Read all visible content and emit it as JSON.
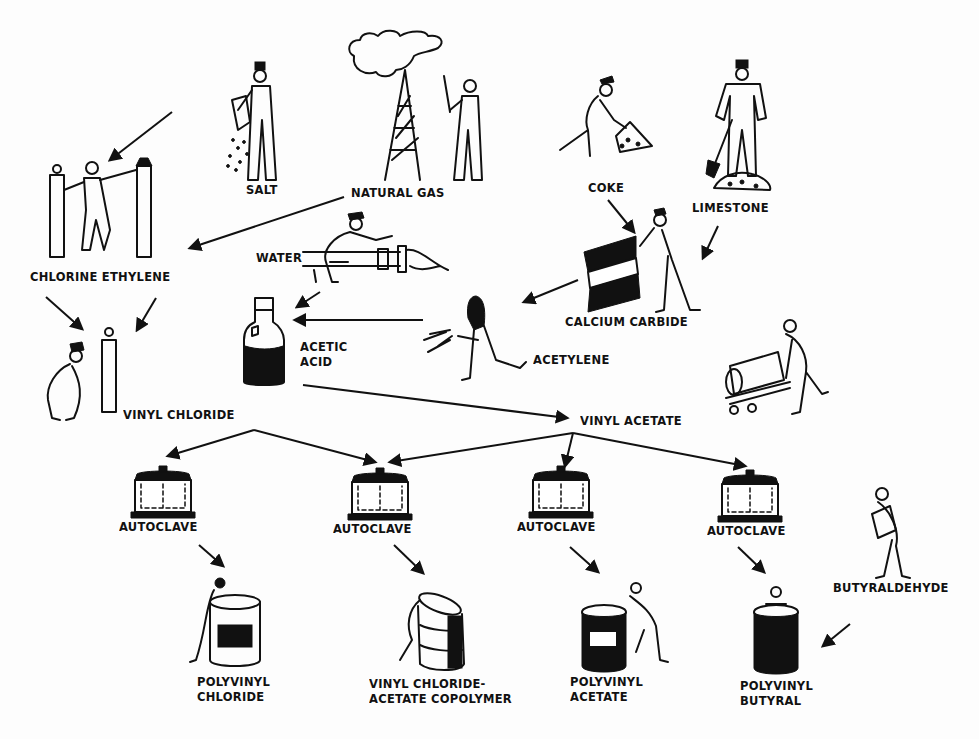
{
  "diagram": {
    "colors": {
      "ink": "#111111",
      "paper": "#fdfdfd"
    },
    "raw_materials": [
      {
        "id": "salt",
        "label": "SALT",
        "x": 246,
        "y": 188,
        "icon": "worker-pouring-salt-icon"
      },
      {
        "id": "natural_gas",
        "label": "NATURAL GAS",
        "x": 351,
        "y": 191,
        "icon": "gas-derrick-icon"
      },
      {
        "id": "coke",
        "label": "COKE",
        "x": 588,
        "y": 186,
        "icon": "worker-shoveling-coke-icon"
      },
      {
        "id": "limestone",
        "label": "LIMESTONE",
        "x": 692,
        "y": 206,
        "icon": "worker-with-limestone-icon"
      },
      {
        "id": "water",
        "label": "WATER",
        "x": 256,
        "y": 256,
        "icon": "water-pipe-worker-icon"
      },
      {
        "id": "butyraldehyde",
        "label": "BUTYRALDEHYDE",
        "x": 833,
        "y": 586,
        "icon": "worker-carrying-drum-icon"
      }
    ],
    "intermediates": [
      {
        "id": "chlorine_ethylene",
        "label": "CHLORINE ETHYLENE",
        "x": 30,
        "y": 275,
        "icon": "gas-cylinders-worker-icon"
      },
      {
        "id": "calcium_carbide",
        "label": "CALCIUM CARBIDE",
        "x": 565,
        "y": 320,
        "icon": "carbide-drum-icon"
      },
      {
        "id": "acetic_acid",
        "label": "ACETIC\nACID",
        "x": 300,
        "y": 345,
        "icon": "acid-bottle-icon"
      },
      {
        "id": "acetylene",
        "label": "ACETYLENE",
        "x": 533,
        "y": 358,
        "icon": "welder-icon"
      },
      {
        "id": "vinyl_chloride",
        "label": "VINYL CHLORIDE",
        "x": 123,
        "y": 413,
        "icon": "cylinder-worker-icon"
      },
      {
        "id": "vinyl_acetate",
        "label": "VINYL ACETATE",
        "x": 580,
        "y": 419,
        "icon": "drum-cart-worker-icon"
      }
    ],
    "autoclaves": [
      {
        "id": "autoclave_1",
        "label": "AUTOCLAVE",
        "x": 119,
        "y": 525,
        "cx": 163
      },
      {
        "id": "autoclave_2",
        "label": "AUTOCLAVE",
        "x": 333,
        "y": 527,
        "cx": 380
      },
      {
        "id": "autoclave_3",
        "label": "AUTOCLAVE",
        "x": 517,
        "y": 525,
        "cx": 561
      },
      {
        "id": "autoclave_4",
        "label": "AUTOCLAVE",
        "x": 707,
        "y": 529,
        "cx": 750
      }
    ],
    "products": [
      {
        "id": "pvc",
        "label": "POLYVINYL\nCHLORIDE",
        "x": 197,
        "y": 680,
        "icon": "drum-pvc-icon"
      },
      {
        "id": "copolymer",
        "label": "VINYL CHLORIDE-\nACETATE COPOLYMER",
        "x": 369,
        "y": 682,
        "icon": "drum-copolymer-icon"
      },
      {
        "id": "pva",
        "label": "POLYVINYL\nACETATE",
        "x": 570,
        "y": 680,
        "icon": "drum-pva-icon"
      },
      {
        "id": "pvb",
        "label": "POLYVINYL\nBUTYRAL",
        "x": 740,
        "y": 684,
        "icon": "drum-pvb-icon"
      }
    ],
    "arrows": [
      {
        "from": "salt",
        "to": "chlorine_ethylene",
        "x1": 172,
        "y1": 112,
        "x2": 110,
        "y2": 160
      },
      {
        "from": "natural_gas",
        "to": "chlorine_ethylene",
        "x1": 344,
        "y1": 197,
        "x2": 190,
        "y2": 248
      },
      {
        "from": "coke",
        "to": "calcium_carbide",
        "x1": 608,
        "y1": 200,
        "x2": 634,
        "y2": 232
      },
      {
        "from": "limestone",
        "to": "calcium_carbide",
        "x1": 718,
        "y1": 226,
        "x2": 703,
        "y2": 258
      },
      {
        "from": "calcium_carbide",
        "to": "acetylene",
        "x1": 578,
        "y1": 280,
        "x2": 524,
        "y2": 302
      },
      {
        "from": "water",
        "to": "acetic_acid",
        "x1": 320,
        "y1": 292,
        "x2": 297,
        "y2": 307
      },
      {
        "from": "acetylene",
        "to": "acetic_acid",
        "x1": 423,
        "y1": 320,
        "x2": 295,
        "y2": 320
      },
      {
        "from": "chlorine_ethylene",
        "to": "vinyl_chloride",
        "x1": 46,
        "y1": 297,
        "x2": 82,
        "y2": 329
      },
      {
        "from": "chlorine_ethylene",
        "to": "vinyl_chloride",
        "x1": 156,
        "y1": 298,
        "x2": 137,
        "y2": 330
      },
      {
        "from": "acetic_acid",
        "to": "vinyl_acetate",
        "x1": 303,
        "y1": 385,
        "x2": 567,
        "y2": 418
      },
      {
        "from": "vinyl_chloride",
        "to": "autoclave_1",
        "x1": 254,
        "y1": 430,
        "x2": 168,
        "y2": 456
      },
      {
        "from": "vinyl_chloride",
        "to": "autoclave_2",
        "x1": 254,
        "y1": 430,
        "x2": 375,
        "y2": 462
      },
      {
        "from": "vinyl_acetate",
        "to": "autoclave_2",
        "x1": 573,
        "y1": 433,
        "x2": 390,
        "y2": 462
      },
      {
        "from": "vinyl_acetate",
        "to": "autoclave_3",
        "x1": 573,
        "y1": 433,
        "x2": 565,
        "y2": 466
      },
      {
        "from": "vinyl_acetate",
        "to": "autoclave_4",
        "x1": 573,
        "y1": 433,
        "x2": 745,
        "y2": 466
      },
      {
        "from": "autoclave_1",
        "to": "pvc",
        "x1": 199,
        "y1": 545,
        "x2": 223,
        "y2": 566
      },
      {
        "from": "autoclave_2",
        "to": "copolymer",
        "x1": 394,
        "y1": 545,
        "x2": 423,
        "y2": 573
      },
      {
        "from": "autoclave_3",
        "to": "pva",
        "x1": 570,
        "y1": 547,
        "x2": 598,
        "y2": 572
      },
      {
        "from": "autoclave_4",
        "to": "pvb",
        "x1": 738,
        "y1": 547,
        "x2": 764,
        "y2": 572
      },
      {
        "from": "butyraldehyde",
        "to": "pvb",
        "x1": 850,
        "y1": 624,
        "x2": 823,
        "y2": 646
      }
    ]
  }
}
